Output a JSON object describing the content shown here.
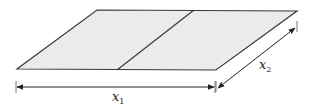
{
  "diagram": {
    "colors": {
      "fill": "#ebebeb",
      "stroke": "#3a3a3a",
      "arrow": "#222222"
    },
    "labels": {
      "x1": {
        "base": "x",
        "subscript": "1"
      },
      "x2": {
        "base": "x",
        "subscript": "2"
      }
    }
  }
}
